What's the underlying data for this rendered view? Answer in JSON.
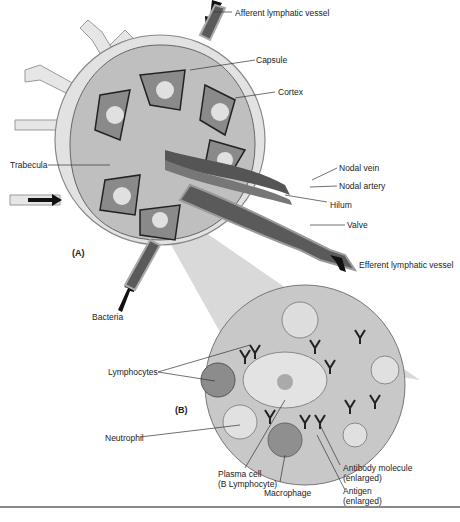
{
  "figure": {
    "panels": [
      {
        "id": "A",
        "label": "(A)",
        "subject": "Lymph node"
      },
      {
        "id": "B",
        "label": "(B)",
        "subject": "Magnified view of lymph node interior"
      }
    ],
    "labels": {
      "afferent": "Afferent lymphatic vessel",
      "capsule": "Capsule",
      "cortex": "Cortex",
      "trabecula": "Trabecula",
      "nodal_vein": "Nodal vein",
      "nodal_artery": "Nodal artery",
      "hilum": "Hilum",
      "valve": "Valve",
      "efferent": "Efferent lymphatic vessel",
      "bacteria": "Bacteria",
      "lymphocytes": "Lymphocytes",
      "neutrophil": "Neutrophil",
      "plasma_cell_1": "Plasma cell",
      "plasma_cell_2": "(B Lymphocyte)",
      "macrophage": "Macrophage",
      "antibody_1": "Antibody molecule",
      "antibody_2": "(enlarged)",
      "antigen_1": "Antigen",
      "antigen_2": "(enlarged)"
    },
    "colors": {
      "node_fill": "#cfcfcf",
      "capsule_fill": "#e4e4e4",
      "vessel_dark": "#5a5a5a",
      "magnify_cone": "#d6d6d6",
      "cell_fill": "#bdbdbd",
      "line": "#333333"
    }
  }
}
